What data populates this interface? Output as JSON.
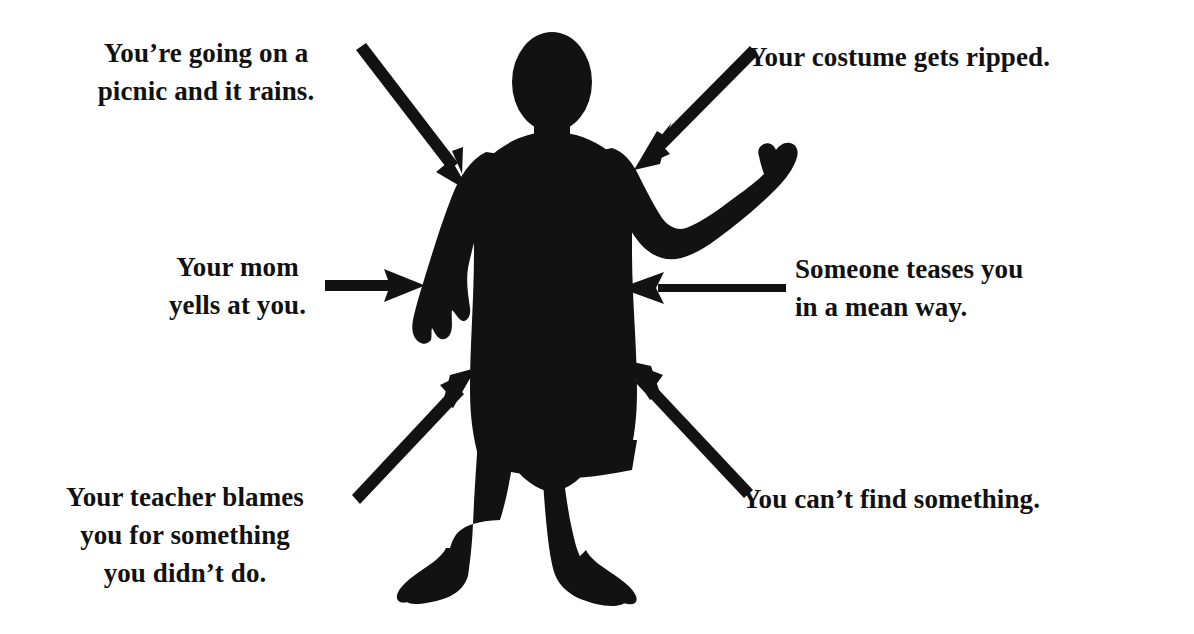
{
  "document": {
    "type": "worksheet-diagram",
    "background_color": "#ffffff",
    "ink_color": "#111111"
  },
  "figure": {
    "name": "child-body-silhouette",
    "fill_color": "#121212"
  },
  "labels": [
    {
      "id": "picnic",
      "text": "You’re going on a\npicnic and it rains.",
      "position": "top-left",
      "align": "center",
      "lines": [
        "You’re going on a",
        "picnic and it rains."
      ]
    },
    {
      "id": "costume",
      "text": "Your costume gets ripped.",
      "position": "top-right",
      "align": "left",
      "lines": [
        "Your costume gets ripped."
      ]
    },
    {
      "id": "mom",
      "text": "Your mom\nyells at you.",
      "position": "middle-left",
      "align": "center",
      "lines": [
        "Your mom",
        "yells at you."
      ]
    },
    {
      "id": "teases",
      "text": "Someone teases you\nin a mean way.",
      "position": "middle-right",
      "align": "left",
      "lines": [
        "Someone teases you",
        "in a mean way."
      ]
    },
    {
      "id": "teacher",
      "text": "Your teacher blames\nyou for something\nyou didn’t do.",
      "position": "bottom-left",
      "align": "center",
      "lines": [
        "Your teacher blames",
        "you for something",
        "you didn’t do."
      ]
    },
    {
      "id": "find",
      "text": "You can’t find something.",
      "position": "bottom-right",
      "align": "left",
      "lines": [
        "You can’t find something."
      ]
    }
  ],
  "arrows": [
    {
      "id": "arrow-picnic",
      "name": "arrow-from-picnic-label",
      "from": [
        356,
        54
      ],
      "to": [
        470,
        190
      ],
      "direction": "down-right",
      "points_at": "upper-left-chest"
    },
    {
      "id": "arrow-costume",
      "name": "arrow-from-costume-label",
      "from": [
        748,
        50
      ],
      "to": [
        634,
        168
      ],
      "direction": "down-left",
      "points_at": "upper-right-chest"
    },
    {
      "id": "arrow-mom",
      "name": "arrow-from-mom-label",
      "from": [
        325,
        285
      ],
      "to": [
        425,
        285
      ],
      "direction": "right",
      "points_at": "left-arm"
    },
    {
      "id": "arrow-teases",
      "name": "arrow-from-teases-label",
      "from": [
        786,
        288
      ],
      "to": [
        620,
        288
      ],
      "direction": "left",
      "points_at": "right-torso"
    },
    {
      "id": "arrow-teacher",
      "name": "arrow-from-teacher-label",
      "from": [
        362,
        500
      ],
      "to": [
        476,
        368
      ],
      "direction": "up-right",
      "points_at": "left-thigh"
    },
    {
      "id": "arrow-find",
      "name": "arrow-from-find-label",
      "from": [
        742,
        494
      ],
      "to": [
        624,
        360
      ],
      "direction": "up-left",
      "points_at": "right-hip"
    }
  ]
}
